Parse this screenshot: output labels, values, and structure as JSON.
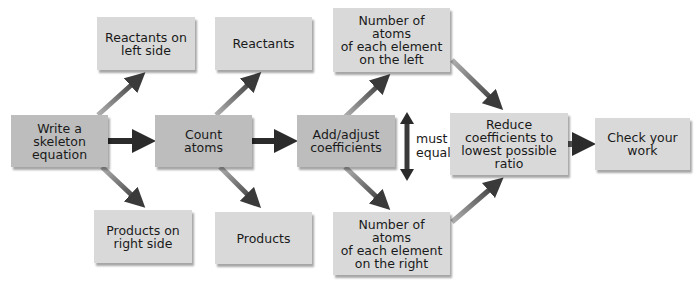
{
  "diagram": {
    "type": "flowchart",
    "nodes": {
      "skeleton": "Write a\nskeleton\nequation",
      "reactants_left": "Reactants on\nleft side",
      "products_right": "Products on\nright side",
      "count": "Count\natoms",
      "reactants": "Reactants",
      "products": "Products",
      "adjust": "Add/adjust\ncoefficients",
      "atoms_left": "Number of atoms\nof each element\non the left",
      "atoms_right": "Number of atoms\nof each element\non the right",
      "reduce": "Reduce\ncoefficients to\nlowest possible\nratio",
      "check": "Check your\nwork"
    },
    "equal_label": "must\nequal",
    "edges": [
      {
        "from": "skeleton",
        "to": "count",
        "style": "main"
      },
      {
        "from": "count",
        "to": "adjust",
        "style": "main"
      },
      {
        "from": "reduce",
        "to": "check",
        "style": "main"
      },
      {
        "from": "skeleton",
        "to": "reactants_left",
        "style": "branch"
      },
      {
        "from": "skeleton",
        "to": "products_right",
        "style": "branch"
      },
      {
        "from": "count",
        "to": "reactants",
        "style": "branch"
      },
      {
        "from": "count",
        "to": "products",
        "style": "branch"
      },
      {
        "from": "adjust",
        "to": "atoms_left",
        "style": "branch"
      },
      {
        "from": "adjust",
        "to": "atoms_right",
        "style": "branch"
      },
      {
        "from": "atoms_left",
        "to": "reduce",
        "style": "branch"
      },
      {
        "from": "atoms_right",
        "to": "reduce",
        "style": "branch"
      },
      {
        "from": "atoms_left",
        "to": "atoms_right",
        "style": "double",
        "label": "must equal"
      }
    ],
    "colors": {
      "box": "#d9d9d9",
      "main_arrow": "#2b2b2b",
      "branch_arrow": "#7a7a7a",
      "text": "#1a1a1a"
    }
  }
}
